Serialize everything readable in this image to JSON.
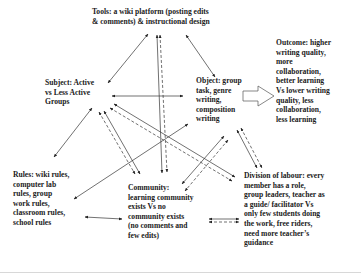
{
  "diagram": {
    "type": "activity-theory-triangle",
    "nodes": {
      "tools": {
        "lines": [
          "Tools: a wiki platform (posting edits",
          "& comments) & instructional design"
        ]
      },
      "subject": {
        "lines": [
          "Subject: Active",
          "vs Less Active",
          "Groups"
        ]
      },
      "object": {
        "lines": [
          "Object: group",
          "task, genre",
          "writing,",
          "composition",
          "writing"
        ]
      },
      "outcome": {
        "lines": [
          "Outcome: higher",
          "writing quality,",
          "more",
          "collaboration,",
          "better learning",
          "Vs lower writing",
          "quality, less",
          "collaboration,",
          "less learning"
        ]
      },
      "rules": {
        "lines": [
          "Rules: wiki rules,",
          "computer lab",
          "rules, group",
          "work rules,",
          "classroom rules,",
          "school rules"
        ]
      },
      "community": {
        "lines": [
          "Community:",
          "learning community",
          "exists Vs no",
          "community exists",
          "(no comments and",
          "few edits)"
        ]
      },
      "division": {
        "lines": [
          "Division of labour: every",
          "member has a role,",
          "group leaders, teacher as",
          "a guide/ facilitator Vs",
          "only few students doing",
          "the work, free riders,",
          "need  more teacher’s",
          "guidance"
        ]
      }
    },
    "edges": [
      {
        "from": "tools",
        "to": "subject",
        "style": "solid"
      },
      {
        "from": "tools",
        "to": "object",
        "style": "solid"
      },
      {
        "from": "tools",
        "to": "community",
        "style": "solid"
      },
      {
        "from": "tools",
        "to": "community",
        "style": "dashed"
      },
      {
        "from": "subject",
        "to": "object",
        "style": "solid"
      },
      {
        "from": "subject",
        "to": "rules",
        "style": "solid"
      },
      {
        "from": "subject",
        "to": "community",
        "style": "solid"
      },
      {
        "from": "subject",
        "to": "community",
        "style": "dashed"
      },
      {
        "from": "subject",
        "to": "division",
        "style": "solid"
      },
      {
        "from": "subject",
        "to": "division",
        "style": "dashed"
      },
      {
        "from": "object",
        "to": "rules",
        "style": "solid"
      },
      {
        "from": "object",
        "to": "community",
        "style": "solid"
      },
      {
        "from": "object",
        "to": "community",
        "style": "dashed"
      },
      {
        "from": "object",
        "to": "division",
        "style": "solid"
      },
      {
        "from": "object",
        "to": "division",
        "style": "dashed"
      },
      {
        "from": "object",
        "to": "outcome",
        "style": "block-arrow"
      },
      {
        "from": "rules",
        "to": "community",
        "style": "solid"
      },
      {
        "from": "community",
        "to": "division",
        "style": "solid"
      },
      {
        "from": "community",
        "to": "division",
        "style": "dashed"
      }
    ]
  }
}
